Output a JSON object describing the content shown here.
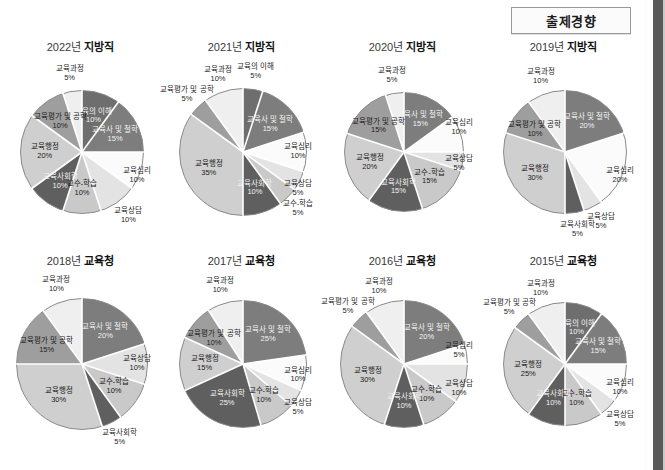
{
  "header": {
    "badge_label": "출제경향"
  },
  "palette": {
    "교육의 이해": "#6e6e6e",
    "교육사 및 철학": "#7d7d7d",
    "교육심리": "#fbfbfb",
    "교육상담": "#e3e3e3",
    "교수-학습": "#c9c9c9",
    "교육사회학": "#5f5f5f",
    "교육행정": "#cfcfcf",
    "교육평가 및 공학": "#9e9e9e",
    "교육과정": "#efefef",
    "stroke": "#ffffff",
    "outline": "#8a8a8a"
  },
  "chart_data": [
    {
      "type": "pie",
      "title": "2022년 지방직",
      "year": "2022년",
      "kind": "지방직",
      "categories": [
        "교육의 이해",
        "교육사 및 철학",
        "교육심리",
        "교육상담",
        "교수-학습",
        "교육사회학",
        "교육행정",
        "교육평가 및 공학",
        "교육과정"
      ],
      "values": [
        10,
        15,
        10,
        10,
        10,
        10,
        20,
        10,
        5
      ],
      "unit": "%"
    },
    {
      "type": "pie",
      "title": "2021년 지방직",
      "year": "2021년",
      "kind": "지방직",
      "categories": [
        "교육의 이해",
        "교육사 및 철학",
        "교육심리",
        "교육상담",
        "교수-학습",
        "교육사회학",
        "교육행정",
        "교육평가 및 공학",
        "교육과정"
      ],
      "values": [
        5,
        15,
        10,
        5,
        5,
        10,
        35,
        5,
        10
      ],
      "unit": "%"
    },
    {
      "type": "pie",
      "title": "2020년 지방직",
      "year": "2020년",
      "kind": "지방직",
      "categories": [
        "교육사 및 철학",
        "교육심리",
        "교육상담",
        "교수-학습",
        "교육사회학",
        "교육행정",
        "교육평가 및 공학",
        "교육과정"
      ],
      "values": [
        15,
        10,
        5,
        15,
        15,
        20,
        15,
        5
      ],
      "unit": "%"
    },
    {
      "type": "pie",
      "title": "2019년 지방직",
      "year": "2019년",
      "kind": "지방직",
      "categories": [
        "교육사 및 철학",
        "교육심리",
        "교육상담",
        "교육사회학",
        "교육행정",
        "교육평가 및 공학",
        "교육과정"
      ],
      "values": [
        20,
        20,
        5,
        5,
        30,
        10,
        10
      ],
      "unit": "%"
    },
    {
      "type": "pie",
      "title": "2018년 교육청",
      "year": "2018년",
      "kind": "교육청",
      "categories": [
        "교육사 및 철학",
        "교육상담",
        "교수-학습",
        "교육사회학",
        "교육행정",
        "교육평가 및 공학",
        "교육과정"
      ],
      "values": [
        20,
        10,
        10,
        5,
        30,
        15,
        10
      ],
      "unit": "%"
    },
    {
      "type": "pie",
      "title": "2017년 교육청",
      "year": "2017년",
      "kind": "교육청",
      "categories": [
        "교육사 및 철학",
        "교육심리",
        "교육상담",
        "교수-학습",
        "교육사회학",
        "교육행정",
        "교육평가 및 공학",
        "교육과정"
      ],
      "values": [
        25,
        10,
        5,
        10,
        25,
        15,
        10,
        10
      ],
      "unit": "%"
    },
    {
      "type": "pie",
      "title": "2016년 교육청",
      "year": "2016년",
      "kind": "교육청",
      "categories": [
        "교육사 및 철학",
        "교육심리",
        "교육상담",
        "교수-학습",
        "교육사회학",
        "교육행정",
        "교육평가 및 공학",
        "교육과정"
      ],
      "values": [
        20,
        5,
        10,
        10,
        10,
        30,
        5,
        10
      ],
      "unit": "%"
    },
    {
      "type": "pie",
      "title": "2015년 교육청",
      "year": "2015년",
      "kind": "교육청",
      "categories": [
        "교육의 이해",
        "교육사 및 철학",
        "교육심리",
        "교육상담",
        "교수-학습",
        "교육사회학",
        "교육행정",
        "교육평가 및 공학",
        "교육과정"
      ],
      "values": [
        10,
        15,
        10,
        5,
        10,
        10,
        25,
        5,
        10
      ],
      "unit": "%"
    }
  ]
}
